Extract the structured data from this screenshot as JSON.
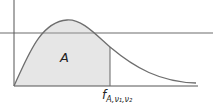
{
  "diagram": {
    "type": "probability-density-curve",
    "area_label": "A",
    "critical_value": {
      "symbol": "f",
      "subscript": "A,ν₁,ν₂"
    },
    "colors": {
      "curve": "#6e6e6e",
      "axes": "#555555",
      "shading": "#e6e6e6",
      "horizontal_rule": "#b5b5b5"
    }
  }
}
